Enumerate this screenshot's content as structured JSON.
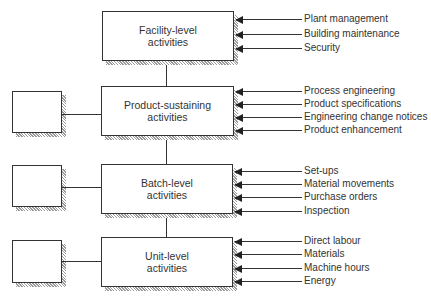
{
  "diagram": {
    "levels": [
      {
        "id": "facility",
        "line1": "Facility-level",
        "line2": "activities",
        "has_side_box": false,
        "drivers": [
          "Plant management",
          "Building maintenance",
          "Security"
        ]
      },
      {
        "id": "product",
        "line1": "Product-sustaining",
        "line2": "activities",
        "has_side_box": true,
        "drivers": [
          "Process engineering",
          "Product specifications",
          "Engineering change notices",
          "Product enhancement"
        ]
      },
      {
        "id": "batch",
        "line1": "Batch-level",
        "line2": "activities",
        "has_side_box": true,
        "drivers": [
          "Set-ups",
          "Material movements",
          "Purchase orders",
          "Inspection"
        ]
      },
      {
        "id": "unit",
        "line1": "Unit-level",
        "line2": "activities",
        "has_side_box": true,
        "drivers": [
          "Direct labour",
          "Materials",
          "Machine hours",
          "Energy"
        ]
      }
    ]
  }
}
